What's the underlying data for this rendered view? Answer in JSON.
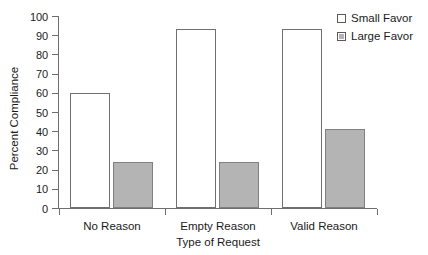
{
  "chart_data": {
    "type": "bar",
    "title": "",
    "xlabel": "Type of Request",
    "ylabel": "Percent Compliance",
    "categories": [
      "No Reason",
      "Empty Reason",
      "Valid Reason"
    ],
    "series": [
      {
        "name": "Small Favor",
        "values": [
          60,
          93,
          93
        ],
        "color": "#ffffff"
      },
      {
        "name": "Large Favor",
        "values": [
          24,
          24,
          41
        ],
        "color": "#b4b4b4"
      }
    ],
    "ylim": [
      0,
      100
    ],
    "ytick_values": [
      0,
      10,
      20,
      30,
      40,
      50,
      60,
      70,
      80,
      90,
      100
    ],
    "ytick_labels": [
      "0",
      "10",
      "20",
      "30",
      "40",
      "50",
      "60",
      "70",
      "80",
      "90",
      "100"
    ],
    "grid": false,
    "legend_position": "top-right",
    "legend_entries": [
      "Small Favor",
      "Large Favor"
    ]
  },
  "legend": {
    "entries": [
      {
        "label": "Small Favor",
        "swatch": "open-square-swatch"
      },
      {
        "label": "Large Favor",
        "swatch": "filled-square-swatch"
      }
    ]
  },
  "axes": {
    "y_title": "Percent Compliance",
    "x_title": "Type of Request"
  }
}
